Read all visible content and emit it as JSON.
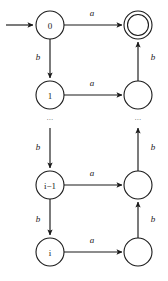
{
  "diagram": {
    "type": "finite-automaton",
    "alphabet": [
      "a",
      "b"
    ],
    "start_state": "0",
    "accepting_states": [
      ""
    ],
    "states": [
      {
        "id": "s0",
        "label": "0",
        "column": "left",
        "row": 0,
        "cx": 50,
        "cy": 25,
        "r": 14,
        "accepting": false,
        "start": true
      },
      {
        "id": "acc",
        "label": "",
        "column": "right",
        "row": 0,
        "cx": 138,
        "cy": 25,
        "r": 14,
        "accepting": true,
        "start": false
      },
      {
        "id": "s1",
        "label": "1",
        "column": "left",
        "row": 1,
        "cx": 50,
        "cy": 95,
        "r": 14,
        "accepting": false,
        "start": false
      },
      {
        "id": "r1",
        "label": "",
        "column": "right",
        "row": 1,
        "cx": 138,
        "cy": 95,
        "r": 14,
        "accepting": false,
        "start": false
      },
      {
        "id": "sim1",
        "label": "i−1",
        "column": "left",
        "row": 2,
        "cx": 50,
        "cy": 185,
        "r": 14,
        "accepting": false,
        "start": false
      },
      {
        "id": "ri1",
        "label": "",
        "column": "right",
        "row": 2,
        "cx": 138,
        "cy": 185,
        "r": 14,
        "accepting": false,
        "start": false
      },
      {
        "id": "si",
        "label": "i",
        "column": "left",
        "row": 3,
        "cx": 50,
        "cy": 252,
        "r": 14,
        "accepting": false,
        "start": false
      },
      {
        "id": "ri",
        "label": "",
        "column": "right",
        "row": 3,
        "cx": 138,
        "cy": 252,
        "r": 14,
        "accepting": false,
        "start": false
      }
    ],
    "transitions": [
      {
        "id": "t-a-0",
        "from": "s0",
        "to": "acc",
        "symbol": "a",
        "direction": "right",
        "label_x": 92,
        "label_y": 13
      },
      {
        "id": "t-a-1",
        "from": "s1",
        "to": "r1",
        "symbol": "a",
        "direction": "right",
        "label_x": 92,
        "label_y": 83
      },
      {
        "id": "t-a-i1",
        "from": "sim1",
        "to": "ri1",
        "symbol": "a",
        "direction": "right",
        "label_x": 92,
        "label_y": 173
      },
      {
        "id": "t-a-i",
        "from": "si",
        "to": "ri",
        "symbol": "a",
        "direction": "right",
        "label_x": 92,
        "label_y": 240
      },
      {
        "id": "t-b-0-1",
        "from": "s0",
        "to": "s1",
        "symbol": "b",
        "direction": "down",
        "label_x": 38,
        "label_y": 57
      },
      {
        "id": "t-b-dn-i1",
        "from": "dots",
        "to": "sim1",
        "symbol": "b",
        "direction": "down",
        "label_x": 38,
        "label_y": 147
      },
      {
        "id": "t-b-i1-i",
        "from": "sim1",
        "to": "si",
        "symbol": "b",
        "direction": "down",
        "label_x": 38,
        "label_y": 219
      },
      {
        "id": "t-b-r1",
        "from": "r1",
        "to": "acc",
        "symbol": "b",
        "direction": "up",
        "label_x": 153,
        "label_y": 57
      },
      {
        "id": "t-b-ri1",
        "from": "ri1",
        "to": "dots",
        "symbol": "b",
        "direction": "up",
        "label_x": 153,
        "label_y": 147
      },
      {
        "id": "t-b-ri",
        "from": "ri",
        "to": "ri1",
        "symbol": "b",
        "direction": "up",
        "label_x": 153,
        "label_y": 219
      }
    ],
    "ellipses": [
      {
        "id": "dots-left",
        "text": "...",
        "x": 50,
        "y": 118
      },
      {
        "id": "dots-right",
        "text": "...",
        "x": 138,
        "y": 118
      }
    ],
    "start_arrow": {
      "x1": 6,
      "x2": 34,
      "y": 25
    },
    "colors": {
      "stroke": "#1a1a1a",
      "fill": "#ffffff",
      "background": "#ffffff",
      "ellipsis": "#555555"
    }
  }
}
